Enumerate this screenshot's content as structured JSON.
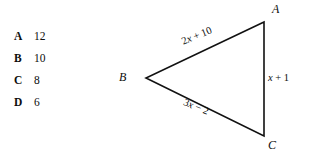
{
  "background_color": "#ffffff",
  "ink_color": "#111111",
  "choices": {
    "items": [
      {
        "letter": "A",
        "value": "12"
      },
      {
        "letter": "B",
        "value": "10"
      },
      {
        "letter": "C",
        "value": "8"
      },
      {
        "letter": "D",
        "value": "6"
      }
    ]
  },
  "figure": {
    "type": "triangle",
    "vertices": [
      {
        "name": "A",
        "label": "A",
        "x": 264,
        "y": 22
      },
      {
        "name": "B",
        "label": "B",
        "x": 146,
        "y": 78
      },
      {
        "name": "C",
        "label": "C",
        "x": 264,
        "y": 136
      }
    ],
    "sides": [
      {
        "name": "AB",
        "label": "2x + 10",
        "label_prefix": "2",
        "label_var": "x",
        "label_suffix": " + 10",
        "rotation_deg": -22.5
      },
      {
        "name": "BC",
        "label": "3x − 2",
        "label_prefix": "3",
        "label_var": "x",
        "label_suffix": " − 2",
        "rotation_deg": 22.5
      },
      {
        "name": "AC",
        "label": "x + 1",
        "label_prefix": "",
        "label_var": "x",
        "label_suffix": " + 1",
        "rotation_deg": 0
      }
    ]
  }
}
